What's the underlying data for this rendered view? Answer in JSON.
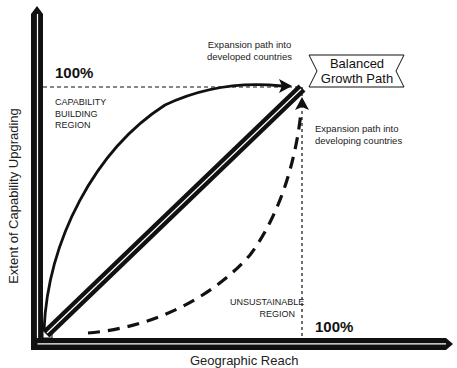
{
  "diagram": {
    "y_axis_label": "Extent of Capability Upgrading",
    "x_axis_label": "Geographic Reach",
    "y_max_label": "100%",
    "x_max_label": "100%",
    "regions": {
      "upper": [
        "CAPABILITY",
        "BUILDING",
        "REGION"
      ],
      "lower": [
        "UNSUSTAINABLE",
        "REGION"
      ]
    },
    "annotations": {
      "developed": [
        "Expansion path into",
        "developed countries"
      ],
      "developing": [
        "Expansion path into",
        "developing countries"
      ]
    },
    "ribbon": [
      "Balanced",
      "Growth Path"
    ],
    "colors": {
      "ink": "#111111",
      "background": "#ffffff"
    }
  }
}
